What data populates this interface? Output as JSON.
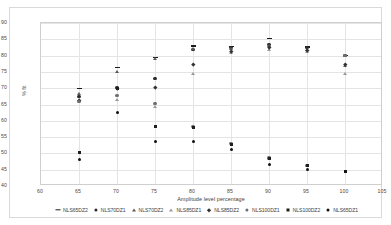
{
  "chart_data": {
    "type": "scatter",
    "title": "",
    "xlabel": "Amplitude level percentage",
    "ylabel": "% fit",
    "xlim": [
      60,
      105
    ],
    "ylim": [
      40,
      90
    ],
    "xticks": [
      60,
      65,
      70,
      75,
      80,
      85,
      90,
      95,
      100,
      105
    ],
    "yticks": [
      40,
      45,
      50,
      55,
      60,
      65,
      70,
      75,
      80,
      85,
      90
    ],
    "grid": true,
    "legend_position": "bottom",
    "x": [
      65,
      70,
      75,
      80,
      85,
      90,
      95,
      100
    ],
    "series": [
      {
        "name": "NLS65DZ2",
        "marker": "dash",
        "values": [
          70.0,
          76.3,
          79.5,
          82.9,
          82.8,
          85.2,
          82.6,
          80.0
        ]
      },
      {
        "name": "NLS70DZ1",
        "marker": "circle",
        "values": [
          67.5,
          70.2,
          73.0,
          81.8,
          82.6,
          83.3,
          82.4,
          80.0
        ]
      },
      {
        "name": "NLS70DZ2",
        "marker": "triangle",
        "values": [
          68.4,
          75.2,
          79.2,
          82.0,
          82.0,
          82.9,
          81.9,
          77.0
        ]
      },
      {
        "name": "NLS85DZ1",
        "marker": "triangle-open",
        "values": [
          66.6,
          66.4,
          64.2,
          74.3,
          81.0,
          81.9,
          81.2,
          74.4
        ]
      },
      {
        "name": "NLS85DZ2",
        "marker": "diamond",
        "values": [
          66.2,
          69.9,
          70.3,
          77.3,
          81.4,
          82.6,
          81.5,
          77.2
        ]
      },
      {
        "name": "NLS100DZ1",
        "marker": "circle-grey",
        "values": [
          65.9,
          67.8,
          65.2,
          58.3,
          53.1,
          48.6,
          46.4,
          80.0
        ]
      },
      {
        "name": "NLS100DZ2",
        "marker": "square",
        "values": [
          50.3,
          70.0,
          58.2,
          57.9,
          52.8,
          48.4,
          46.2,
          44.6
        ]
      },
      {
        "name": "NLS65DZ1",
        "marker": "circle-dark",
        "values": [
          48.0,
          62.4,
          53.5,
          53.6,
          51.3,
          46.7,
          45.0,
          44.5
        ]
      }
    ]
  }
}
